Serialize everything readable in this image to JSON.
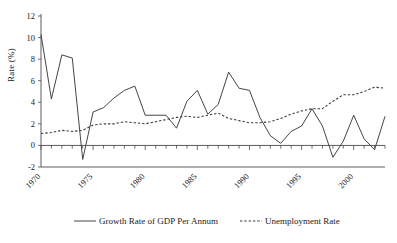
{
  "chart_data": {
    "type": "line",
    "title": "",
    "xlabel": "",
    "ylabel": "Rate (%)",
    "ylim": [
      -2,
      12
    ],
    "xlim": [
      1970,
      2003
    ],
    "yticks": [
      -2,
      0,
      2,
      4,
      6,
      8,
      10,
      12
    ],
    "ytick_labels": [
      "-2",
      "0",
      "2",
      "4",
      "6",
      "8",
      "10",
      "12"
    ],
    "xticks": [
      1970,
      1975,
      1980,
      1985,
      1990,
      1995,
      2000
    ],
    "xtick_labels": [
      "1970",
      "1975",
      "1980",
      "1985",
      "1990",
      "1995",
      "2000"
    ],
    "xtick_rotation": -45,
    "minor_xticks": "every year 1970-2003",
    "grid": false,
    "legend_position": "bottom",
    "x": [
      1970,
      1971,
      1972,
      1973,
      1974,
      1975,
      1976,
      1977,
      1978,
      1979,
      1980,
      1981,
      1982,
      1983,
      1984,
      1985,
      1986,
      1987,
      1988,
      1989,
      1990,
      1991,
      1992,
      1993,
      1994,
      1995,
      1996,
      1997,
      1998,
      1999,
      2000,
      2001,
      2002,
      2003
    ],
    "series": [
      {
        "name": "Growth Rate of GDP Per Annum",
        "style": "solid",
        "color": "#3b3b3b",
        "values": [
          10.3,
          4.3,
          8.4,
          8.1,
          -1.3,
          3.1,
          3.5,
          4.4,
          5.1,
          5.5,
          2.8,
          2.8,
          2.8,
          1.6,
          4.1,
          5.1,
          2.9,
          3.8,
          6.8,
          5.3,
          5.1,
          2.6,
          0.9,
          0.2,
          1.3,
          1.8,
          3.4,
          1.8,
          -1.1,
          0.4,
          2.8,
          0.6,
          -0.4,
          2.7
        ]
      },
      {
        "name": "Unemployment Rate",
        "style": "dashed",
        "color": "#3b3b3b",
        "values": [
          1.1,
          1.2,
          1.4,
          1.3,
          1.4,
          1.9,
          2.0,
          2.0,
          2.2,
          2.1,
          2.0,
          2.2,
          2.4,
          2.6,
          2.7,
          2.6,
          2.8,
          3.0,
          2.5,
          2.3,
          2.1,
          2.1,
          2.2,
          2.5,
          2.9,
          3.2,
          3.4,
          3.4,
          4.1,
          4.7,
          4.7,
          5.0,
          5.4,
          5.3
        ]
      }
    ],
    "legend": [
      {
        "label": "Growth Rate of GDP Per Annum",
        "style": "solid"
      },
      {
        "label": "Unemployment Rate",
        "style": "dashed"
      }
    ]
  }
}
